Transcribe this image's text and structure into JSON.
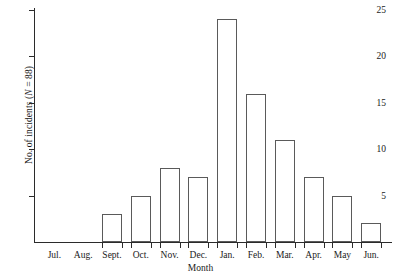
{
  "chart_data": {
    "type": "bar",
    "title": "",
    "xlabel": "Month",
    "ylabel": "No. of incidents (N = 88)",
    "ylabel_prefix": "No. of incidents (",
    "ylabel_italic": "N",
    "ylabel_suffix": " = 88)",
    "categories": [
      "Jul.",
      "Aug.",
      "Sept.",
      "Oct.",
      "Nov.",
      "Dec.",
      "Jan.",
      "Feb.",
      "Mar.",
      "Apr.",
      "May",
      "Jun."
    ],
    "values": [
      0,
      0,
      3,
      5,
      8,
      7,
      24,
      16,
      11,
      7,
      5,
      2
    ],
    "total": 88,
    "ylim": [
      0,
      25
    ],
    "ytick_labels": [
      "5",
      "10",
      "15",
      "20",
      "25"
    ],
    "ytick_values": [
      5,
      10,
      15,
      20,
      25
    ],
    "grid": false,
    "legend": false,
    "bar_fill_color": "#ffffff",
    "bar_edge_color": "#5a5a5a",
    "axis_color": "#2b2b2b"
  }
}
